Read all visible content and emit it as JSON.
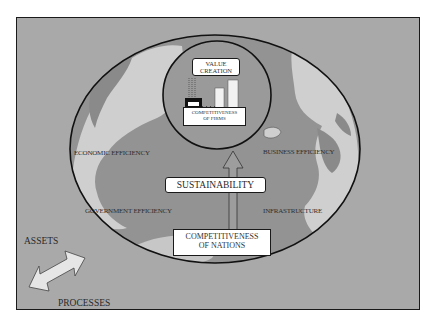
{
  "diagram": {
    "title_top": "VALUE CREATION",
    "value_creation": [
      "VALUE",
      "CREATION"
    ],
    "firms": [
      "COMPETITIVENESS",
      "OF FIRMS"
    ],
    "sustainability": "SUSTAINABILITY",
    "nations": [
      "COMPETITIVENESS",
      "OF NATIONS"
    ],
    "factors": {
      "economic": "ECONOMIC EFFICIENCY",
      "business": "BUSINESS EFFICIENCY",
      "government": "GOVERNMENT EFFICIENCY",
      "infrastructure": "INFRASTRUCTURE"
    },
    "assets": "ASSETS",
    "processes": "PROCESSES",
    "colors": {
      "background": "#a9a9a9",
      "land_light": "#cfcfcf",
      "land_dark": "#8f8f8f",
      "outline": "#1a1a1a",
      "box": "#ffffff"
    }
  }
}
